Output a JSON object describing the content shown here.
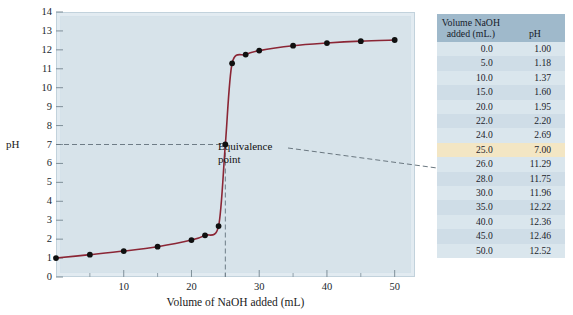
{
  "figure": {
    "kind": "titration-curve-figure"
  },
  "chart_data": {
    "type": "line",
    "title": "",
    "xlabel": "Volume of NaOH added (mL)",
    "ylabel": "pH",
    "xlim": [
      0,
      53
    ],
    "ylim": [
      0,
      14
    ],
    "xticks": [
      10,
      20,
      30,
      40,
      50
    ],
    "yticks": [
      0,
      1,
      2,
      3,
      4,
      5,
      6,
      7,
      8,
      9,
      10,
      11,
      12,
      13,
      14
    ],
    "grid": false,
    "legend": "none",
    "line_color": "#8b2635",
    "marker_color": "#101010",
    "plot_background": "#d7e3ea",
    "x": [
      0.0,
      5.0,
      10.0,
      15.0,
      20.0,
      22.0,
      24.0,
      25.0,
      26.0,
      28.0,
      30.0,
      35.0,
      40.0,
      45.0,
      50.0
    ],
    "values": [
      1.0,
      1.18,
      1.37,
      1.6,
      1.95,
      2.2,
      2.69,
      7.0,
      11.29,
      11.75,
      11.96,
      12.22,
      12.36,
      12.46,
      12.52
    ],
    "annotations": [
      {
        "label": "Equivalence\npoint",
        "x": 25.0,
        "y": 7.0
      }
    ]
  },
  "table": {
    "headers": {
      "volume": "Volume NaOH\nadded (mL.)",
      "ph": "pH"
    },
    "highlight_color": "#f3e6c4",
    "header_color": "#9fb9cb",
    "rows": [
      {
        "volume": "0.0",
        "ph": "1.00",
        "highlight": false
      },
      {
        "volume": "5.0",
        "ph": "1.18",
        "highlight": false
      },
      {
        "volume": "10.0",
        "ph": "1.37",
        "highlight": false
      },
      {
        "volume": "15.0",
        "ph": "1.60",
        "highlight": false
      },
      {
        "volume": "20.0",
        "ph": "1.95",
        "highlight": false
      },
      {
        "volume": "22.0",
        "ph": "2.20",
        "highlight": false
      },
      {
        "volume": "24.0",
        "ph": "2.69",
        "highlight": false
      },
      {
        "volume": "25.0",
        "ph": "7.00",
        "highlight": true
      },
      {
        "volume": "26.0",
        "ph": "11.29",
        "highlight": false
      },
      {
        "volume": "28.0",
        "ph": "11.75",
        "highlight": false
      },
      {
        "volume": "30.0",
        "ph": "11.96",
        "highlight": false
      },
      {
        "volume": "35.0",
        "ph": "12.22",
        "highlight": false
      },
      {
        "volume": "40.0",
        "ph": "12.36",
        "highlight": false
      },
      {
        "volume": "45.0",
        "ph": "12.46",
        "highlight": false
      },
      {
        "volume": "50.0",
        "ph": "12.52",
        "highlight": false
      }
    ]
  }
}
